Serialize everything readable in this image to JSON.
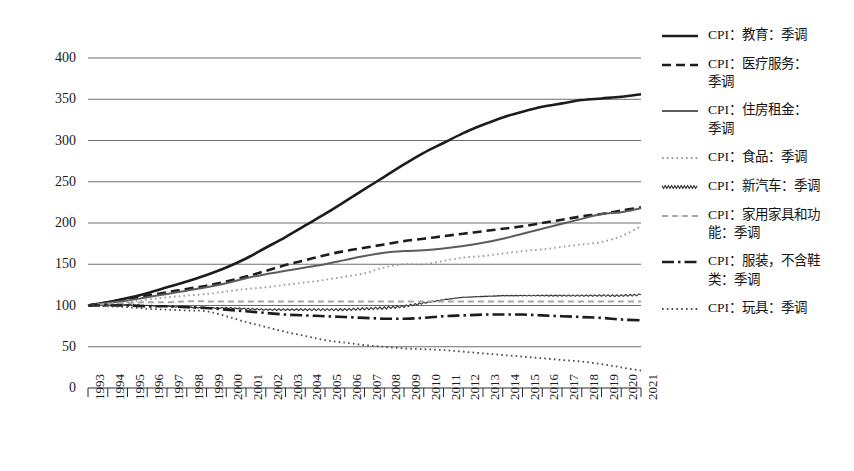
{
  "chart_data": {
    "type": "line",
    "title": "",
    "xlabel": "",
    "ylabel": "",
    "xlim": [
      1993,
      2021
    ],
    "ylim": [
      0,
      400
    ],
    "ytick_labels": [
      "400",
      "350",
      "300",
      "250",
      "200",
      "150",
      "100",
      "50",
      "0"
    ],
    "ytick_values": [
      400,
      350,
      300,
      250,
      200,
      150,
      100,
      50,
      0
    ],
    "grid": "horizontal",
    "legend_position": "right",
    "x": [
      1993,
      1994,
      1995,
      1996,
      1997,
      1998,
      1999,
      2000,
      2001,
      2002,
      2003,
      2004,
      2005,
      2006,
      2007,
      2008,
      2009,
      2010,
      2011,
      2012,
      2013,
      2014,
      2015,
      2016,
      2017,
      2018,
      2019,
      2020,
      2021
    ],
    "xtick_labels": [
      "1993",
      "1994",
      "1995",
      "1996",
      "1997",
      "1998",
      "1999",
      "2000",
      "2001",
      "2002",
      "2003",
      "2004",
      "2005",
      "2006",
      "2007",
      "2008",
      "2009",
      "2010",
      "2011",
      "2012",
      "2013",
      "2014",
      "2015",
      "2016",
      "2017",
      "2018",
      "2019",
      "2020",
      "2021"
    ],
    "series": [
      {
        "name": "CPI：教育：季调",
        "style": "solid",
        "color": "#1c1c1c",
        "width": 2.6,
        "values": [
          100,
          104,
          109,
          115,
          122,
          129,
          137,
          146,
          157,
          170,
          183,
          197,
          211,
          226,
          241,
          256,
          271,
          285,
          297,
          309,
          319,
          328,
          335,
          341,
          345,
          349,
          351,
          353,
          356
        ]
      },
      {
        "name": "CPI：医疗服务：季调",
        "style": "dashed",
        "color": "#1c1c1c",
        "width": 2.6,
        "values": [
          100,
          104,
          108,
          112,
          116,
          120,
          124,
          129,
          135,
          142,
          149,
          155,
          161,
          166,
          170,
          174,
          178,
          181,
          184,
          187,
          190,
          193,
          196,
          200,
          204,
          208,
          211,
          215,
          219
        ]
      },
      {
        "name": "CPI：住房租金：季调",
        "style": "solid",
        "color": "#5c5c5c",
        "width": 2.0,
        "values": [
          100,
          103,
          106,
          110,
          114,
          118,
          122,
          127,
          133,
          138,
          142,
          146,
          150,
          155,
          160,
          164,
          166,
          167,
          169,
          172,
          176,
          181,
          187,
          193,
          199,
          205,
          211,
          213,
          218
        ]
      },
      {
        "name": "CPI：食品：季调",
        "style": "dotted",
        "color": "#9a9a9a",
        "width": 1.8,
        "values": [
          100,
          102,
          104,
          107,
          110,
          112,
          114,
          117,
          120,
          122,
          125,
          128,
          131,
          135,
          139,
          146,
          150,
          150,
          154,
          158,
          160,
          163,
          166,
          168,
          171,
          174,
          177,
          184,
          196
        ]
      },
      {
        "name": "CPI：新汽车：季调",
        "style": "wavy",
        "color": "#3a3a3a",
        "width": 1.2,
        "values": [
          100,
          101,
          101,
          100,
          99,
          98,
          97,
          97,
          96,
          95,
          95,
          95,
          95,
          95,
          96,
          97,
          99,
          103,
          107,
          110,
          111,
          112,
          112,
          112,
          112,
          112,
          112,
          112,
          113
        ]
      },
      {
        "name": "CPI：家用家具和功能：季调",
        "style": "dashed",
        "color": "#a6a6a6",
        "width": 2.0,
        "values": [
          100,
          102,
          103,
          104,
          104,
          105,
          105,
          105,
          105,
          105,
          105,
          105,
          105,
          105,
          105,
          105,
          105,
          105,
          105,
          105,
          105,
          105,
          105,
          105,
          105,
          105,
          105,
          105,
          105
        ]
      },
      {
        "name": "CPI：服装，不含鞋类：季调",
        "style": "dashdot",
        "color": "#1c1c1c",
        "width": 2.6,
        "values": [
          100,
          100,
          100,
          99,
          99,
          98,
          97,
          95,
          93,
          91,
          89,
          88,
          87,
          86,
          85,
          84,
          84,
          85,
          87,
          88,
          89,
          89,
          89,
          88,
          87,
          86,
          85,
          83,
          82
        ]
      },
      {
        "name": "CPI：玩具：季调",
        "style": "dotted",
        "color": "#4a4a4a",
        "width": 1.8,
        "values": [
          100,
          99,
          98,
          96,
          95,
          94,
          93,
          87,
          80,
          74,
          68,
          63,
          58,
          55,
          52,
          50,
          48,
          47,
          46,
          44,
          42,
          40,
          38,
          36,
          34,
          32,
          29,
          25,
          21
        ]
      }
    ]
  },
  "legend": {
    "items": [
      {
        "label_lines": [
          "CPI：教育：季调"
        ]
      },
      {
        "label_lines": [
          "CPI：医疗服务：",
          "季调"
        ]
      },
      {
        "label_lines": [
          "CPI：住房租金：",
          "季调"
        ]
      },
      {
        "label_lines": [
          "CPI：食品：季调"
        ]
      },
      {
        "label_lines": [
          "CPI：新汽车：季调"
        ]
      },
      {
        "label_lines": [
          "CPI：家用家具和功",
          "能：季调"
        ]
      },
      {
        "label_lines": [
          "CPI：服装，不含鞋",
          "类：季调"
        ]
      },
      {
        "label_lines": [
          "CPI：玩具：季调"
        ]
      }
    ]
  }
}
